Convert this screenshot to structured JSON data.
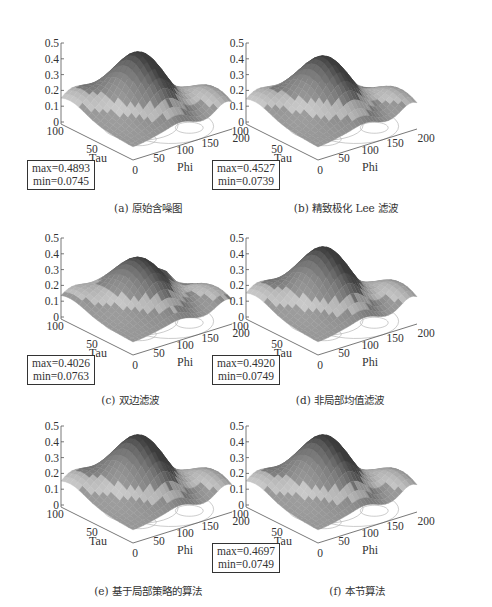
{
  "figure": {
    "panels": [
      {
        "id": "a",
        "caption": "(a) 原始含噪图",
        "max": "max=0.4893",
        "min": "min=0.0745",
        "show_box": true,
        "variant": "noisy"
      },
      {
        "id": "b",
        "caption": "(b) 精致极化 Lee 滤波",
        "max": "max=0.4527",
        "min": "min=0.0739",
        "show_box": true,
        "variant": "lee"
      },
      {
        "id": "c",
        "caption": "(c) 双边滤波",
        "max": "max=0.4026",
        "min": "min=0.0763",
        "show_box": true,
        "variant": "bilateral"
      },
      {
        "id": "d",
        "caption": "(d) 非局部均值滤波",
        "max": "max=0.4920",
        "min": "min=0.0749",
        "show_box": true,
        "variant": "nlm"
      },
      {
        "id": "e",
        "caption": "(e) 基于局部策略的算法",
        "max": "",
        "min": "",
        "show_box": false,
        "variant": "local"
      },
      {
        "id": "f",
        "caption": "(f) 本节算法",
        "max": "max=0.4697",
        "min": "min=0.0749",
        "show_box": true,
        "variant": "proposed"
      }
    ],
    "axes": {
      "z_ticks": [
        "0",
        "0.1",
        "0.2",
        "0.3",
        "0.4",
        "0.5"
      ],
      "tau_ticks": [
        "100",
        "50",
        "0"
      ],
      "phi_ticks": [
        "50",
        "100",
        "150",
        "200"
      ],
      "tau_label": "Tau",
      "phi_label": "Phi"
    }
  },
  "chart_data": [
    {
      "type": "surface3d",
      "title": "(a) 原始含噪图",
      "xlabel": "Phi",
      "ylabel": "Tau",
      "zlabel": "",
      "xlim": [
        0,
        200
      ],
      "ylim": [
        0,
        100
      ],
      "zlim": [
        0,
        0.5
      ],
      "x_ticks": [
        50,
        100,
        150,
        200
      ],
      "y_ticks": [
        0,
        50,
        100
      ],
      "z_ticks": [
        0,
        0.1,
        0.2,
        0.3,
        0.4,
        0.5
      ],
      "max": 0.4893,
      "min": 0.0745,
      "contour_on_base": true
    },
    {
      "type": "surface3d",
      "title": "(b) 精致极化 Lee 滤波",
      "xlabel": "Phi",
      "ylabel": "Tau",
      "xlim": [
        0,
        200
      ],
      "ylim": [
        0,
        100
      ],
      "zlim": [
        0,
        0.5
      ],
      "x_ticks": [
        50,
        100,
        150,
        200
      ],
      "y_ticks": [
        0,
        50,
        100
      ],
      "z_ticks": [
        0,
        0.1,
        0.2,
        0.3,
        0.4,
        0.5
      ],
      "max": 0.4527,
      "min": 0.0739,
      "contour_on_base": true
    },
    {
      "type": "surface3d",
      "title": "(c) 双边滤波",
      "xlabel": "Phi",
      "ylabel": "Tau",
      "xlim": [
        0,
        200
      ],
      "ylim": [
        0,
        100
      ],
      "zlim": [
        0,
        0.5
      ],
      "x_ticks": [
        50,
        100,
        150,
        200
      ],
      "y_ticks": [
        0,
        50,
        100
      ],
      "z_ticks": [
        0,
        0.1,
        0.2,
        0.3,
        0.4,
        0.5
      ],
      "max": 0.4026,
      "min": 0.0763,
      "contour_on_base": true
    },
    {
      "type": "surface3d",
      "title": "(d) 非局部均值滤波",
      "xlabel": "Phi",
      "ylabel": "Tau",
      "xlim": [
        0,
        200
      ],
      "ylim": [
        0,
        100
      ],
      "zlim": [
        0,
        0.5
      ],
      "x_ticks": [
        50,
        100,
        150,
        200
      ],
      "y_ticks": [
        0,
        50,
        100
      ],
      "z_ticks": [
        0,
        0.1,
        0.2,
        0.3,
        0.4,
        0.5
      ],
      "max": 0.492,
      "min": 0.0749,
      "contour_on_base": true
    },
    {
      "type": "surface3d",
      "title": "(e) 基于局部策略的算法",
      "xlabel": "Phi",
      "ylabel": "Tau",
      "xlim": [
        0,
        200
      ],
      "ylim": [
        0,
        100
      ],
      "zlim": [
        0,
        0.5
      ],
      "x_ticks": [
        50,
        100,
        150,
        200
      ],
      "y_ticks": [
        0,
        50,
        100
      ],
      "z_ticks": [
        0,
        0.1,
        0.2,
        0.3,
        0.4,
        0.5
      ],
      "max": null,
      "min": null,
      "contour_on_base": true
    },
    {
      "type": "surface3d",
      "title": "(f) 本节算法",
      "xlabel": "Phi",
      "ylabel": "Tau",
      "xlim": [
        0,
        200
      ],
      "ylim": [
        0,
        100
      ],
      "zlim": [
        0,
        0.5
      ],
      "x_ticks": [
        50,
        100,
        150,
        200
      ],
      "y_ticks": [
        0,
        50,
        100
      ],
      "z_ticks": [
        0,
        0.1,
        0.2,
        0.3,
        0.4,
        0.5
      ],
      "max": 0.4697,
      "min": 0.0749,
      "contour_on_base": true
    }
  ]
}
